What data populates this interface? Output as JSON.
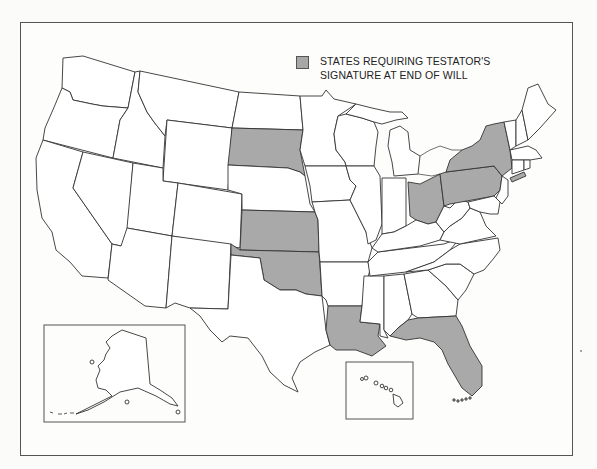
{
  "legend": {
    "label": "STATES REQUIRING TESTATOR'S SIGNATURE AT END OF WILL",
    "swatch_color": "#a9a9a9"
  },
  "map": {
    "type": "choropleth",
    "region": "United States",
    "highlighted_states": [
      "South Dakota",
      "Kansas",
      "Oklahoma",
      "Louisiana",
      "Florida",
      "Ohio",
      "Pennsylvania",
      "New York"
    ],
    "highlight_color": "#a9a9a9",
    "default_color": "#ffffff",
    "insets": [
      "Alaska",
      "Hawaii"
    ]
  }
}
